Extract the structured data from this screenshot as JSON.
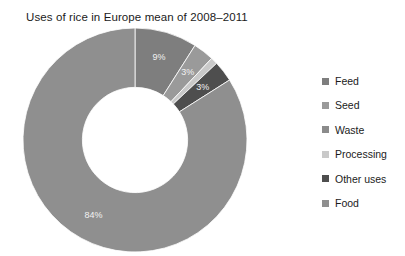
{
  "chart_data": {
    "type": "pie",
    "variant": "donut",
    "title": "Uses of rice in Europe mean of 2008–2011",
    "xlabel": "",
    "ylabel": "",
    "units": "percent",
    "start_angle_deg": 0,
    "direction": "clockwise",
    "inner_radius_ratio": 0.47,
    "legend_position": "right",
    "grid": false,
    "background_color": "#ffffff",
    "categories": [
      "Feed",
      "Seed",
      "Waste",
      "Processing",
      "Other uses",
      "Food"
    ],
    "values": [
      9,
      3,
      0,
      1,
      3,
      84
    ],
    "data_labels": [
      "9%",
      "3%",
      "0%",
      "",
      "3%",
      "84%"
    ],
    "colors": [
      "#7e7e7e",
      "#9a9a9a",
      "#8b8b8b",
      "#c9c9c9",
      "#4e4e4e",
      "#8f8f8f"
    ],
    "slices": [
      {
        "label": "Feed",
        "value": 9,
        "display": "9%",
        "color": "#7e7e7e"
      },
      {
        "label": "Seed",
        "value": 3,
        "display": "3%",
        "color": "#9a9a9a"
      },
      {
        "label": "Waste",
        "value": 0,
        "display": "0%",
        "color": "#8b8b8b"
      },
      {
        "label": "Processing",
        "value": 1,
        "display": "",
        "color": "#c9c9c9"
      },
      {
        "label": "Other uses",
        "value": 3,
        "display": "3%",
        "color": "#4e4e4e"
      },
      {
        "label": "Food",
        "value": 84,
        "display": "84%",
        "color": "#8f8f8f"
      }
    ]
  },
  "title": {
    "text": "Uses of rice in Europe mean of 2008–2011"
  },
  "legend": {
    "items": [
      {
        "label": "Feed",
        "color": "#7e7e7e"
      },
      {
        "label": "Seed",
        "color": "#9a9a9a"
      },
      {
        "label": "Waste",
        "color": "#8b8b8b"
      },
      {
        "label": "Processing",
        "color": "#c9c9c9"
      },
      {
        "label": "Other uses",
        "color": "#4e4e4e"
      },
      {
        "label": "Food",
        "color": "#8f8f8f"
      }
    ]
  },
  "slice_labels": {
    "feed": "9%",
    "seed": "3%",
    "waste": "0%",
    "other_uses": "3%",
    "food": "84%"
  }
}
